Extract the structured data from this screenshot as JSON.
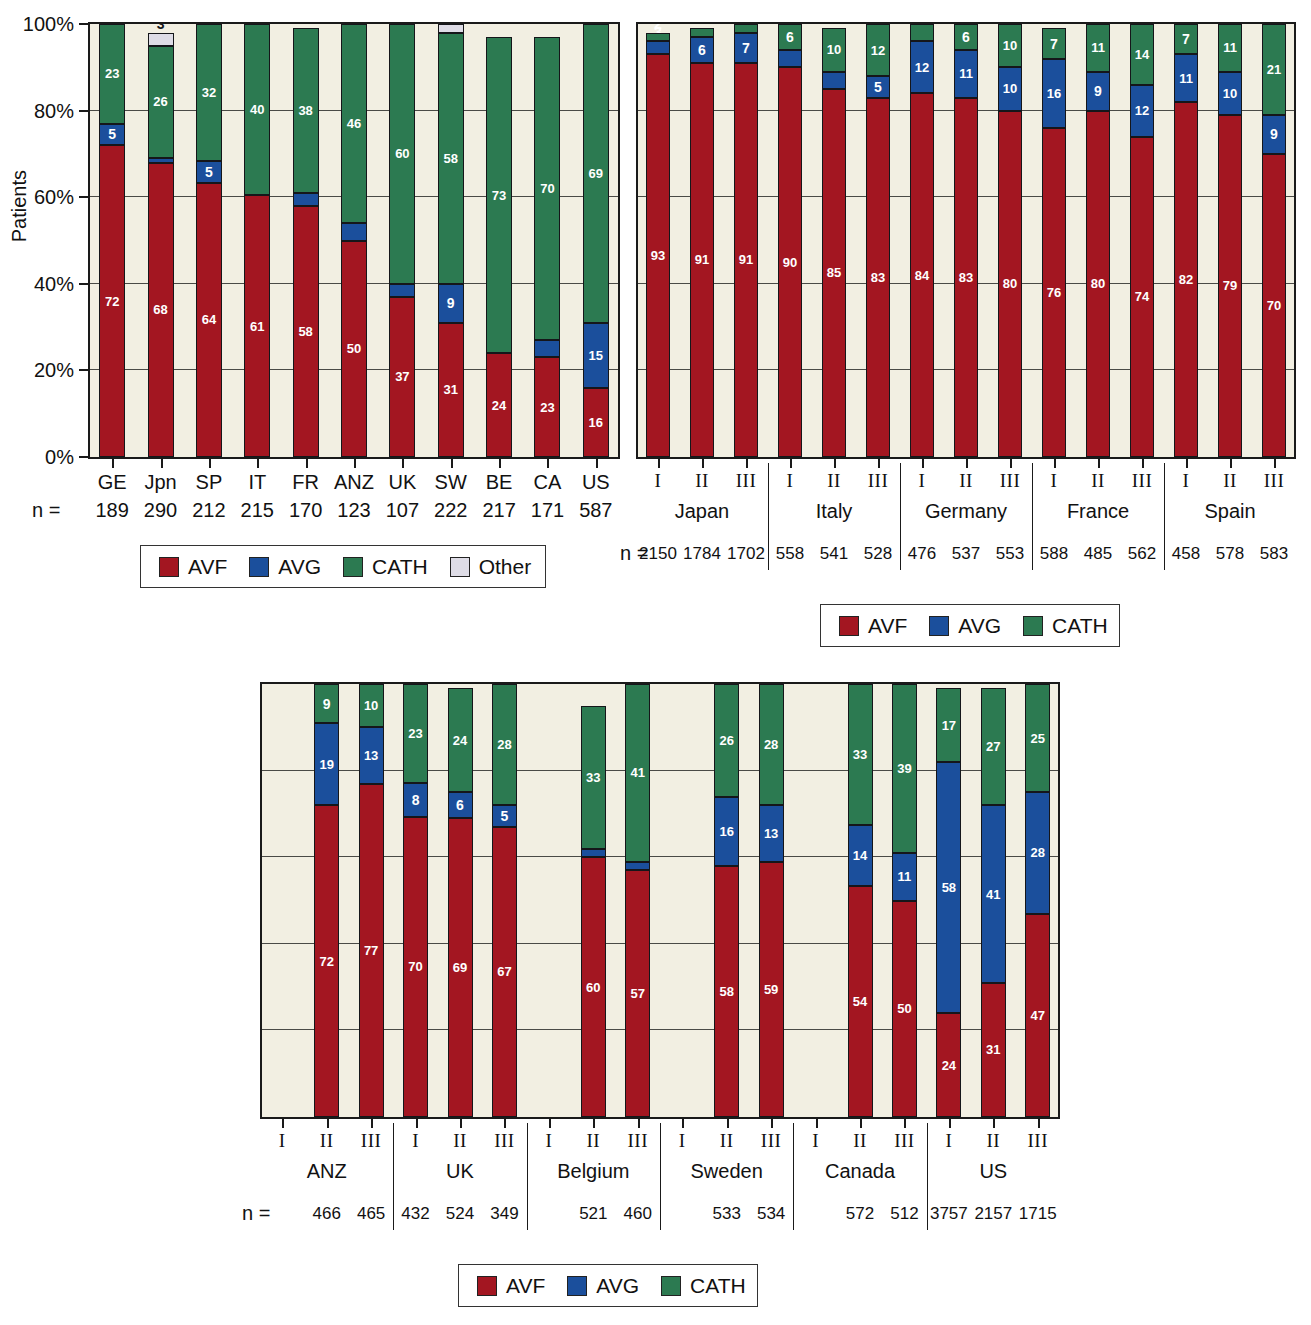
{
  "colors": {
    "avf": "#A31621",
    "avg": "#1B4F9C",
    "cath": "#2C7A51",
    "other": "#DEDCE6",
    "plot_bg": "#F2EFE2",
    "axis": "#1a1a1a"
  },
  "legend_labels": {
    "avf": "AVF",
    "avg": "AVG",
    "cath": "CATH",
    "other": "Other"
  },
  "n_equals": "n =",
  "chart_data": [
    {
      "id": "chart-countries",
      "type": "bar",
      "subtype": "stacked-100-percent",
      "title": "",
      "xlabel": "",
      "ylabel": "Patients",
      "ylim": [
        0,
        100
      ],
      "ytick_labels": [
        "0%",
        "20%",
        "40%",
        "60%",
        "80%",
        "100%"
      ],
      "ytick_values": [
        0,
        20,
        40,
        60,
        80,
        100
      ],
      "grid": true,
      "legend_position": "bottom",
      "legend": [
        "AVF",
        "AVG",
        "CATH",
        "Other"
      ],
      "categories": [
        "GE",
        "Jpn",
        "SP",
        "IT",
        "FR",
        "ANZ",
        "UK",
        "SW",
        "BE",
        "CA",
        "US"
      ],
      "n": [
        189,
        290,
        212,
        215,
        170,
        123,
        107,
        222,
        217,
        171,
        587
      ],
      "series": [
        {
          "name": "AVF",
          "values": [
            72,
            68,
            64,
            61,
            58,
            50,
            37,
            31,
            24,
            23,
            16
          ]
        },
        {
          "name": "AVG",
          "values": [
            5,
            1,
            5,
            null,
            3,
            4,
            3,
            9,
            null,
            4,
            15
          ]
        },
        {
          "name": "CATH",
          "values": [
            23,
            26,
            32,
            40,
            38,
            46,
            60,
            58,
            73,
            70,
            69
          ]
        },
        {
          "name": "Other",
          "values": [
            null,
            3,
            null,
            null,
            null,
            null,
            null,
            2,
            null,
            null,
            null
          ]
        }
      ]
    },
    {
      "id": "chart-regions-a",
      "type": "bar",
      "subtype": "stacked-100-percent",
      "title": "",
      "xlabel": "",
      "ylabel": "",
      "ylim": [
        0,
        100
      ],
      "ytick_labels": [],
      "grid": true,
      "legend_position": "bottom",
      "legend": [
        "AVF",
        "AVG",
        "CATH"
      ],
      "groups": [
        {
          "label": "Japan",
          "phases": [
            "I",
            "II",
            "III"
          ],
          "n": [
            2150,
            1784,
            1702
          ],
          "avf": [
            93,
            91,
            91
          ],
          "avg": [
            3,
            6,
            7
          ],
          "cath": [
            2,
            2,
            2
          ]
        },
        {
          "label": "Italy",
          "phases": [
            "I",
            "II",
            "III"
          ],
          "n": [
            558,
            541,
            528
          ],
          "avf": [
            90,
            85,
            83
          ],
          "avg": [
            4,
            4,
            5
          ],
          "cath": [
            6,
            10,
            12
          ]
        },
        {
          "label": "Germany",
          "phases": [
            "I",
            "II",
            "III"
          ],
          "n": [
            476,
            537,
            553
          ],
          "avf": [
            84,
            83,
            80
          ],
          "avg": [
            12,
            11,
            10
          ],
          "cath": [
            4,
            6,
            10
          ]
        },
        {
          "label": "France",
          "phases": [
            "I",
            "II",
            "III"
          ],
          "n": [
            588,
            485,
            562
          ],
          "avf": [
            76,
            80,
            74
          ],
          "avg": [
            16,
            9,
            12
          ],
          "cath": [
            7,
            11,
            14
          ]
        },
        {
          "label": "Spain",
          "phases": [
            "I",
            "II",
            "III"
          ],
          "n": [
            458,
            578,
            583
          ],
          "avf": [
            82,
            79,
            70
          ],
          "avg": [
            11,
            10,
            9
          ],
          "cath": [
            7,
            11,
            21
          ]
        }
      ]
    },
    {
      "id": "chart-regions-b",
      "type": "bar",
      "subtype": "stacked-100-percent",
      "title": "",
      "xlabel": "",
      "ylabel": "",
      "ylim": [
        0,
        100
      ],
      "ytick_labels": [],
      "grid": true,
      "legend_position": "bottom",
      "legend": [
        "AVF",
        "AVG",
        "CATH"
      ],
      "groups": [
        {
          "label": "ANZ",
          "phases": [
            "I",
            "II",
            "III"
          ],
          "n": [
            null,
            466,
            465
          ],
          "avf": [
            null,
            72,
            77
          ],
          "avg": [
            null,
            19,
            13
          ],
          "cath": [
            null,
            9,
            10
          ]
        },
        {
          "label": "UK",
          "phases": [
            "I",
            "II",
            "III"
          ],
          "n": [
            432,
            524,
            349
          ],
          "avf": [
            70,
            69,
            67
          ],
          "avg": [
            8,
            6,
            5
          ],
          "cath": [
            23,
            24,
            28
          ]
        },
        {
          "label": "Belgium",
          "phases": [
            "I",
            "II",
            "III"
          ],
          "n": [
            null,
            521,
            460
          ],
          "avf": [
            null,
            60,
            57
          ],
          "avg": [
            null,
            2,
            2
          ],
          "cath": [
            null,
            33,
            41
          ]
        },
        {
          "label": "Sweden",
          "phases": [
            "I",
            "II",
            "III"
          ],
          "n": [
            null,
            533,
            534
          ],
          "avf": [
            null,
            58,
            59
          ],
          "avg": [
            null,
            16,
            13
          ],
          "cath": [
            null,
            26,
            28
          ]
        },
        {
          "label": "Canada",
          "phases": [
            "I",
            "II",
            "III"
          ],
          "n": [
            null,
            572,
            512
          ],
          "avf": [
            null,
            54,
            50
          ],
          "avg": [
            null,
            14,
            11
          ],
          "cath": [
            null,
            33,
            39
          ]
        },
        {
          "label": "US",
          "phases": [
            "I",
            "II",
            "III"
          ],
          "n": [
            3757,
            2157,
            1715
          ],
          "avf": [
            24,
            31,
            47
          ],
          "avg": [
            58,
            41,
            28
          ],
          "cath": [
            17,
            27,
            25
          ]
        }
      ]
    }
  ]
}
